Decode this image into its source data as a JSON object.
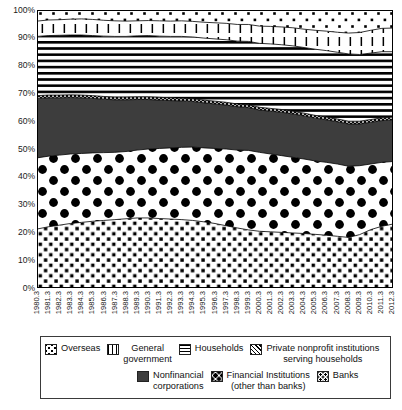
{
  "chart_data": {
    "type": "area",
    "stacked": true,
    "normalized": true,
    "title": "",
    "subtitle": "",
    "xlabel": "",
    "ylabel": "",
    "ylim": [
      0,
      100
    ],
    "yticks": [
      "0%",
      "10%",
      "20%",
      "30%",
      "40%",
      "50%",
      "60%",
      "70%",
      "80%",
      "90%",
      "100%"
    ],
    "ytick_values": [
      0,
      10,
      20,
      30,
      40,
      50,
      60,
      70,
      80,
      90,
      100
    ],
    "grid": false,
    "legend_position": "bottom",
    "categories": [
      "1980.3",
      "1981.3",
      "1982.3",
      "1983.3",
      "1984.3",
      "1985.3",
      "1986.3",
      "1987.3",
      "1988.3",
      "1989.3",
      "1990.3",
      "1991.3",
      "1992.3",
      "1993.3",
      "1994.3",
      "1995.3",
      "1996.3",
      "1997.3",
      "1998.3",
      "1999.3",
      "2000.3",
      "2001.3",
      "2002.3",
      "2003.3",
      "2004.3",
      "2005.3",
      "2006.3",
      "2007.3",
      "2008.3",
      "2009.3",
      "2010.3",
      "2011.3",
      "2012.3"
    ],
    "series": [
      {
        "name": "Banks",
        "pattern": "small-dots",
        "values": [
          21.2,
          22.0,
          22.6,
          23.2,
          23.6,
          24.0,
          24.3,
          24.6,
          24.9,
          25.2,
          25.2,
          25.0,
          24.8,
          24.6,
          24.3,
          23.8,
          23.2,
          22.4,
          21.6,
          20.9,
          20.4,
          20.2,
          20.0,
          19.8,
          19.6,
          19.3,
          19.0,
          18.6,
          18.2,
          19.2,
          21.0,
          22.2,
          23.0
        ]
      },
      {
        "name": "Financial Institutions (other than banks)",
        "pattern": "large-dots",
        "values": [
          25.6,
          25.4,
          25.2,
          25.0,
          24.8,
          24.6,
          24.4,
          24.2,
          24.2,
          24.4,
          24.8,
          25.2,
          25.6,
          26.0,
          26.4,
          26.6,
          27.0,
          27.6,
          28.0,
          28.6,
          28.4,
          28.0,
          27.6,
          27.2,
          26.8,
          26.4,
          26.2,
          26.0,
          25.6,
          24.8,
          23.6,
          23.0,
          22.5
        ]
      },
      {
        "name": "Nonfinancial corporations",
        "pattern": "solid-dark",
        "values": [
          21.4,
          21.0,
          20.6,
          20.3,
          20.0,
          19.6,
          19.2,
          18.9,
          18.6,
          18.2,
          17.8,
          17.4,
          17.0,
          16.7,
          16.4,
          16.2,
          16.0,
          15.8,
          15.6,
          15.4,
          15.2,
          15.4,
          15.6,
          15.6,
          15.5,
          15.4,
          15.3,
          15.2,
          15.2,
          15.0,
          15.0,
          15.0,
          15.0
        ]
      },
      {
        "name": "Private nonprofit institutions serving households",
        "pattern": "cross-hatch",
        "values": [
          1.0,
          1.0,
          1.0,
          1.0,
          1.0,
          1.0,
          1.0,
          1.0,
          1.0,
          1.0,
          1.0,
          1.0,
          1.0,
          1.0,
          1.0,
          1.0,
          1.0,
          1.0,
          1.0,
          1.0,
          1.0,
          1.0,
          1.0,
          1.0,
          1.0,
          1.0,
          1.0,
          1.0,
          1.0,
          1.0,
          1.0,
          1.0,
          1.0
        ]
      },
      {
        "name": "Households",
        "pattern": "horizontal-lines",
        "values": [
          21.3,
          21.4,
          21.5,
          21.5,
          21.6,
          21.6,
          21.7,
          21.8,
          21.8,
          21.9,
          22.0,
          22.0,
          22.1,
          22.2,
          22.2,
          22.3,
          22.4,
          22.5,
          22.6,
          22.8,
          23.0,
          23.2,
          23.3,
          23.5,
          23.6,
          23.8,
          23.9,
          24.0,
          24.2,
          24.0,
          23.9,
          23.8,
          23.5
        ]
      },
      {
        "name": "General government",
        "pattern": "vertical-dashes",
        "values": [
          5.5,
          5.6,
          5.6,
          5.7,
          5.8,
          5.8,
          5.7,
          5.6,
          5.5,
          5.4,
          5.4,
          5.5,
          5.5,
          5.6,
          5.6,
          5.7,
          5.8,
          5.9,
          6.0,
          6.1,
          6.2,
          6.3,
          6.4,
          6.5,
          6.6,
          6.8,
          7.0,
          7.2,
          7.5,
          7.9,
          8.2,
          8.4,
          8.5
        ]
      },
      {
        "name": "Overseas",
        "pattern": "scatter-dots",
        "values": [
          4.0,
          3.6,
          3.5,
          3.3,
          3.2,
          3.4,
          3.7,
          3.9,
          4.0,
          3.9,
          3.8,
          3.9,
          4.0,
          3.9,
          4.1,
          4.4,
          4.6,
          4.8,
          5.2,
          5.2,
          5.8,
          5.9,
          6.1,
          6.4,
          6.9,
          7.3,
          7.6,
          8.0,
          8.3,
          8.1,
          7.3,
          6.6,
          6.5
        ]
      }
    ]
  },
  "legend": {
    "rows": [
      {
        "items": [
          {
            "label": "Overseas",
            "swatch": "sw-overseas",
            "icon": "scatter-dots-swatch-icon"
          },
          {
            "label": "General\ngovernment",
            "swatch": "sw-gov",
            "icon": "vertical-dashes-swatch-icon"
          },
          {
            "label": "Households",
            "swatch": "sw-house",
            "icon": "horizontal-lines-swatch-icon"
          },
          {
            "label": "Private nonprofit institutions\nserving households",
            "swatch": "sw-npish",
            "icon": "cross-hatch-swatch-icon"
          }
        ]
      },
      {
        "items": [
          {
            "label": "Nonfinancial\ncorporations",
            "swatch": "sw-nfc",
            "icon": "solid-dark-swatch-icon"
          },
          {
            "label": "Financial Institutions\n(other than banks)",
            "swatch": "sw-fin",
            "icon": "large-dots-swatch-icon"
          },
          {
            "label": "Banks",
            "swatch": "sw-banks",
            "icon": "small-dots-swatch-icon"
          }
        ]
      }
    ]
  },
  "colors": {
    "nonfinancial": "#3d3d3d",
    "axis": "#1a1a1a",
    "plot_border": "#000000",
    "background": "#ffffff"
  }
}
